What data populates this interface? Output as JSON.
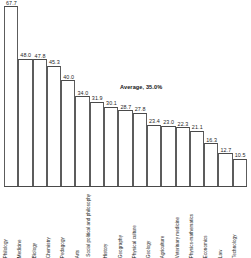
{
  "chart_data": {
    "type": "bar",
    "title": "",
    "subtitle": "",
    "xlabel": "",
    "ylabel": "",
    "ylim": [
      0,
      70
    ],
    "grid": false,
    "legend": "none",
    "orientation": "vertical",
    "bar_style": "outline",
    "annotations": [
      {
        "name": "average-annotation",
        "text": "Average, 35.0%",
        "value": 35.0
      }
    ],
    "categories": [
      "Philology",
      "Medicine",
      "Biology",
      "Chemistry",
      "Pedagogy",
      "Arts",
      "Social political and philosophy",
      "History",
      "Geography",
      "Physical culture",
      "Geology",
      "Agriculture",
      "Veterinary medicine",
      "Physics-mathematics",
      "Economics",
      "Law",
      "Technology"
    ],
    "values": [
      67.7,
      48.0,
      47.8,
      45.3,
      40.0,
      34.0,
      31.9,
      30.1,
      28.7,
      27.8,
      23.4,
      23.0,
      22.3,
      21.1,
      16.3,
      12.7,
      10.5
    ],
    "value_labels": [
      "67.7",
      "48.0",
      "47.8",
      "45.3",
      "40.0",
      "34.0",
      "31.9",
      "30.1",
      "28.7",
      "27.8",
      "23.4",
      "23.0",
      "22.3",
      "21.1",
      "16.3",
      "12.7",
      "10.5"
    ],
    "colors": {
      "bar_fill": "#ffffff",
      "bar_stroke": "#4a4a4a",
      "axis": "#4a4a4a",
      "text": "#1a1a1a",
      "background": "#ffffff"
    }
  }
}
